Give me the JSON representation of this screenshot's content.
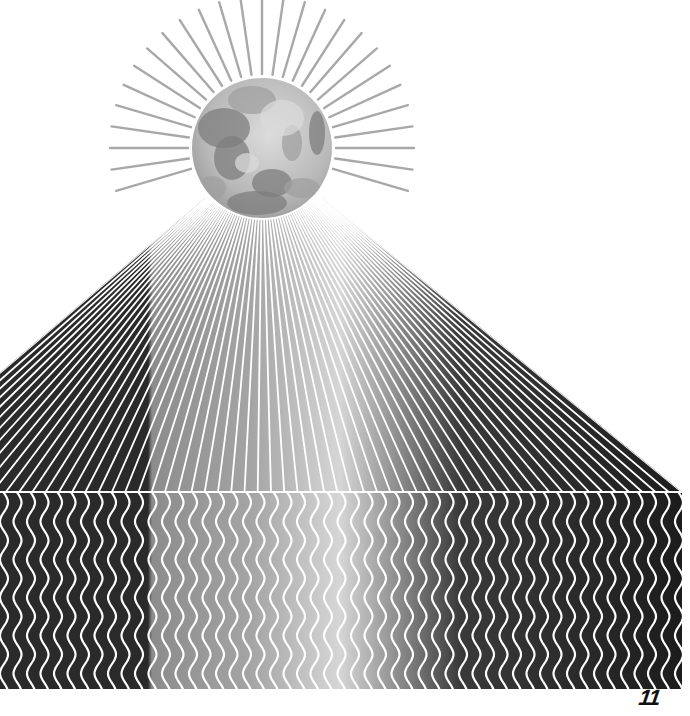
{
  "illustration": {
    "title": "Moon over striped pyramid op-art illustration",
    "background": "#ffffff",
    "moon": {
      "cx": 262,
      "cy": 148,
      "r": 70,
      "base_color": "#bdbdbd",
      "highlight_color": "#d9d9d9",
      "mare_color": "#7d7d7d",
      "mid_color": "#a0a0a0"
    },
    "sun_rays": {
      "count": 44,
      "inner_radius": 74,
      "outer_radius": 152,
      "color": "#9a9a9a",
      "width": 2.4
    },
    "pyramid": {
      "apex_left": [
        205,
        198
      ],
      "apex_right": [
        322,
        198
      ],
      "base_y": 492,
      "left_x_at_base": -140,
      "right_x_at_base": 682,
      "stripe_count": 62,
      "line_color": "#ffffff",
      "ridge_line_color": "#ffffff"
    },
    "wave_band": {
      "top": 493,
      "bottom": 689,
      "left": 0,
      "right": 682,
      "pitch": 13.5,
      "amplitude": 4,
      "period": 38,
      "line_color": "#ffffff",
      "shade_stops": [
        {
          "x": 0,
          "color": "#2a2a2a"
        },
        {
          "x": 148,
          "color": "#2a2a2a"
        },
        {
          "x": 152,
          "color": "#8c8c8c"
        },
        {
          "x": 250,
          "color": "#a4a4a4"
        },
        {
          "x": 340,
          "color": "#d6d6d6"
        },
        {
          "x": 400,
          "color": "#8a8a8a"
        },
        {
          "x": 460,
          "color": "#3a3a3a"
        },
        {
          "x": 682,
          "color": "#1c1c1c"
        }
      ]
    }
  },
  "page": {
    "number": "11"
  }
}
